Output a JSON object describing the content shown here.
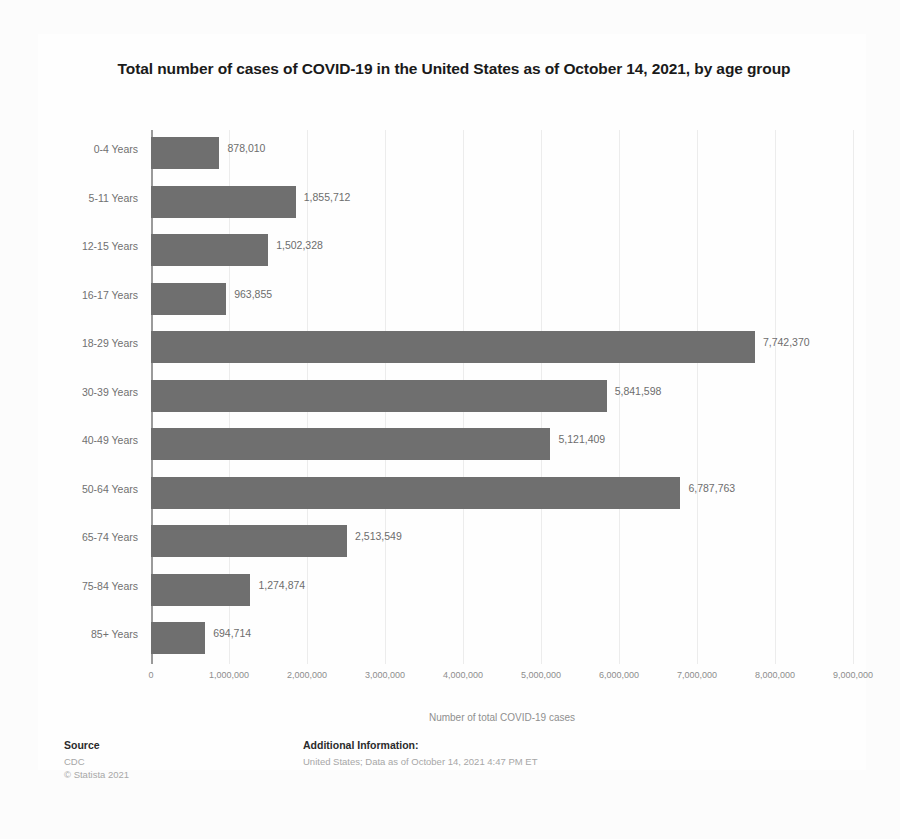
{
  "chart_data": {
    "type": "bar",
    "orientation": "horizontal",
    "title": "Total number of cases of COVID-19 in the United States as of October 14, 2021, by age group",
    "xlabel": "Number of total COVID-19 cases",
    "ylabel": "",
    "categories": [
      "0-4 Years",
      "5-11 Years",
      "12-15 Years",
      "16-17 Years",
      "18-29 Years",
      "30-39 Years",
      "40-49 Years",
      "50-64 Years",
      "65-74 Years",
      "75-84 Years",
      "85+ Years"
    ],
    "values": [
      878010,
      1855712,
      1502328,
      963855,
      7742370,
      5841598,
      5121409,
      6787763,
      2513549,
      1274874,
      694714
    ],
    "value_labels": [
      "878,010",
      "1,855,712",
      "1,502,328",
      "963,855",
      "7,742,370",
      "5,841,598",
      "5,121,409",
      "6,787,763",
      "2,513,549",
      "1,274,874",
      "694,714"
    ],
    "xlim": [
      0,
      9000000
    ],
    "xticks": [
      0,
      1000000,
      2000000,
      3000000,
      4000000,
      5000000,
      6000000,
      7000000,
      8000000,
      9000000
    ],
    "xtick_labels": [
      "0",
      "1,000,000",
      "2,000,000",
      "3,000,000",
      "4,000,000",
      "5,000,000",
      "6,000,000",
      "7,000,000",
      "8,000,000",
      "9,000,000"
    ],
    "grid": true,
    "legend": false,
    "bar_color": "#6f6f6f"
  },
  "footer": {
    "source_heading": "Source",
    "source_name": "CDC",
    "copyright": "© Statista 2021",
    "additional_heading": "Additional Information:",
    "additional_text": "United States; Data as of October 14, 2021 4:47 PM ET"
  }
}
